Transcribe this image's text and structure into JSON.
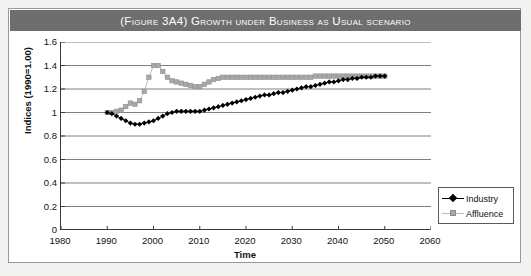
{
  "figure": {
    "title": "(Figure 3A4) Growth under Business as Usual scenario"
  },
  "chart_data": {
    "type": "line",
    "title": "(Figure 3A4) Growth under Business as Usual scenario",
    "xlabel": "Time",
    "ylabel": "Indices (1990=1.00)",
    "xlim": [
      1980,
      2060
    ],
    "ylim": [
      0,
      1.6
    ],
    "xticks": [
      1980,
      1990,
      2000,
      2010,
      2020,
      2030,
      2040,
      2050,
      2060
    ],
    "yticks": [
      0,
      0.2,
      0.4,
      0.6,
      0.8,
      1,
      1.2,
      1.4,
      1.6
    ],
    "ytick_labels": [
      "0",
      "0.2",
      "0.4",
      "0.6",
      "0.8",
      "1",
      "1.2",
      "1.4",
      "1.6"
    ],
    "xtick_labels": [
      "1980",
      "1990",
      "2000",
      "2010",
      "2020",
      "2030",
      "2040",
      "2050",
      "2060"
    ],
    "grid": "horizontal",
    "legend_position": "bottom-right-inside",
    "series": [
      {
        "name": "Industry",
        "color": "#000000",
        "marker": "diamond",
        "x": [
          1990,
          1991,
          1992,
          1993,
          1994,
          1995,
          1996,
          1997,
          1998,
          1999,
          2000,
          2001,
          2002,
          2003,
          2004,
          2005,
          2006,
          2007,
          2008,
          2009,
          2010,
          2011,
          2012,
          2013,
          2014,
          2015,
          2016,
          2017,
          2018,
          2019,
          2020,
          2021,
          2022,
          2023,
          2024,
          2025,
          2026,
          2027,
          2028,
          2029,
          2030,
          2031,
          2032,
          2033,
          2034,
          2035,
          2036,
          2037,
          2038,
          2039,
          2040,
          2041,
          2042,
          2043,
          2044,
          2045,
          2046,
          2047,
          2048,
          2049,
          2050
        ],
        "y": [
          1.0,
          0.99,
          0.97,
          0.95,
          0.93,
          0.91,
          0.9,
          0.9,
          0.91,
          0.92,
          0.93,
          0.95,
          0.97,
          0.99,
          1.0,
          1.01,
          1.01,
          1.01,
          1.01,
          1.01,
          1.01,
          1.02,
          1.03,
          1.04,
          1.05,
          1.06,
          1.07,
          1.08,
          1.09,
          1.1,
          1.11,
          1.12,
          1.13,
          1.14,
          1.15,
          1.15,
          1.16,
          1.17,
          1.17,
          1.18,
          1.19,
          1.2,
          1.21,
          1.22,
          1.22,
          1.23,
          1.24,
          1.25,
          1.26,
          1.26,
          1.27,
          1.28,
          1.28,
          1.29,
          1.29,
          1.3,
          1.3,
          1.3,
          1.31,
          1.31,
          1.31
        ]
      },
      {
        "name": "Affluence",
        "color": "#a8a8a8",
        "marker": "square",
        "x": [
          1990,
          1991,
          1992,
          1993,
          1994,
          1995,
          1996,
          1997,
          1998,
          1999,
          2000,
          2001,
          2002,
          2003,
          2004,
          2005,
          2006,
          2007,
          2008,
          2009,
          2010,
          2011,
          2012,
          2013,
          2014,
          2015,
          2016,
          2017,
          2018,
          2019,
          2020,
          2021,
          2022,
          2023,
          2024,
          2025,
          2026,
          2027,
          2028,
          2029,
          2030,
          2031,
          2032,
          2033,
          2034,
          2035,
          2036,
          2037,
          2038,
          2039,
          2040,
          2041,
          2042,
          2043,
          2044,
          2045,
          2046,
          2047,
          2048,
          2049,
          2050
        ],
        "y": [
          1.0,
          1.0,
          1.01,
          1.02,
          1.05,
          1.08,
          1.07,
          1.1,
          1.18,
          1.3,
          1.4,
          1.4,
          1.35,
          1.3,
          1.27,
          1.26,
          1.25,
          1.24,
          1.23,
          1.22,
          1.22,
          1.24,
          1.26,
          1.28,
          1.29,
          1.3,
          1.3,
          1.3,
          1.3,
          1.3,
          1.3,
          1.3,
          1.3,
          1.3,
          1.3,
          1.3,
          1.3,
          1.3,
          1.3,
          1.3,
          1.3,
          1.3,
          1.3,
          1.3,
          1.3,
          1.31,
          1.31,
          1.31,
          1.31,
          1.31,
          1.31,
          1.31,
          1.31,
          1.31,
          1.31,
          1.31,
          1.31,
          1.31,
          1.31,
          1.31,
          1.31
        ]
      }
    ]
  },
  "legend": {
    "items": [
      {
        "label": "Industry"
      },
      {
        "label": "Affluence"
      }
    ]
  }
}
